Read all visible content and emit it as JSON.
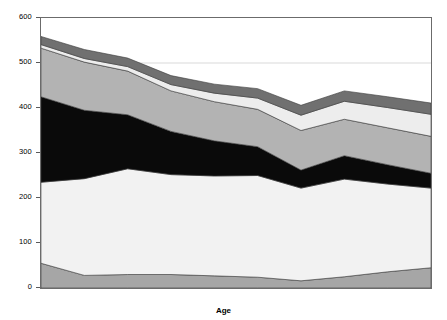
{
  "chart_data": {
    "type": "area",
    "title": "",
    "subtitle": "",
    "xlabel": "Age",
    "ylabel": "",
    "xlim": [
      5,
      85
    ],
    "ylim": [
      0,
      600
    ],
    "grid": true,
    "gridlines_y": [
      500
    ],
    "legend_position": "inline-labels",
    "stacked": true,
    "x_categorical": true,
    "categories": [
      "5",
      "10",
      "15",
      "25",
      "35",
      "45",
      "55",
      "65",
      "75",
      "85"
    ],
    "x": [
      5,
      10,
      15,
      25,
      35,
      45,
      55,
      65,
      75,
      85
    ],
    "y_ticks": [
      0,
      100,
      200,
      300,
      400,
      500,
      600
    ],
    "x_ticks": [
      5,
      10,
      15,
      25,
      35,
      45,
      55,
      65,
      75,
      85
    ],
    "units": "minutes",
    "series": [
      {
        "name": "Stage 1",
        "color": "#a6a6a6",
        "values": [
          55,
          28,
          30,
          30,
          27,
          24,
          16,
          25,
          36,
          45
        ]
      },
      {
        "name": "Stage 2",
        "color": "#f2f2f2",
        "values": [
          180,
          215,
          235,
          222,
          222,
          226,
          206,
          217,
          195,
          177
        ]
      },
      {
        "name": "SWS",
        "color": "#0a0a0a",
        "values": [
          190,
          152,
          120,
          96,
          78,
          64,
          40,
          52,
          43,
          33
        ]
      },
      {
        "name": "REM",
        "color": "#b3b3b3",
        "values": [
          108,
          107,
          97,
          90,
          87,
          83,
          88,
          81,
          82,
          82
        ]
      },
      {
        "name": "WASO",
        "color": "#ededed",
        "values": [
          8,
          8,
          10,
          14,
          19,
          25,
          34,
          40,
          45,
          49
        ]
      },
      {
        "name": "Sleep Latency",
        "color": "#707070",
        "values": [
          18,
          20,
          19,
          20,
          20,
          21,
          22,
          23,
          24,
          25
        ]
      }
    ],
    "cumulative_totals": [
      559,
      530,
      511,
      472,
      453,
      443,
      406,
      438,
      425,
      411
    ],
    "annotations": [
      {
        "text": "Sleep Latency",
        "x_px": 238,
        "y_px": 92
      },
      {
        "text": "WASO",
        "x_px": 232,
        "y_px": 105
      },
      {
        "text": "REM",
        "x_px": 232,
        "y_px": 131
      },
      {
        "text": "SWS",
        "x_px": 228,
        "y_px": 168
      },
      {
        "text": "Stage 2",
        "x_px": 228,
        "y_px": 231
      },
      {
        "text": "Stage 1",
        "x_px": 228,
        "y_px": 281
      }
    ]
  },
  "axis": {
    "x_title": "Age",
    "y_tick_labels": [
      "0",
      "100",
      "200",
      "300",
      "400",
      "500",
      "600"
    ],
    "x_tick_labels": [
      "5",
      "10",
      "15",
      "25",
      "35",
      "45",
      "55",
      "65",
      "75",
      "85"
    ]
  },
  "colors": {
    "stage1": "#a6a6a6",
    "stage2": "#f2f2f2",
    "sws": "#0a0a0a",
    "rem": "#b3b3b3",
    "waso": "#ededed",
    "sleep_latency": "#707070",
    "axis": "#6b6b6b",
    "gridline": "#c8c8c8",
    "background": "#ffffff"
  }
}
